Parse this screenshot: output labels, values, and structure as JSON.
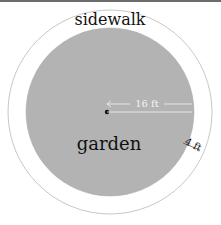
{
  "diagram": {
    "outer_label": "sidewalk",
    "inner_label": "garden",
    "radius_label": "16 ft",
    "width_label": "4 ft",
    "colors": {
      "garden_fill": "#b3b3b3",
      "sidewalk_fill": "#ffffff",
      "stroke": "#c8c8c8"
    }
  }
}
